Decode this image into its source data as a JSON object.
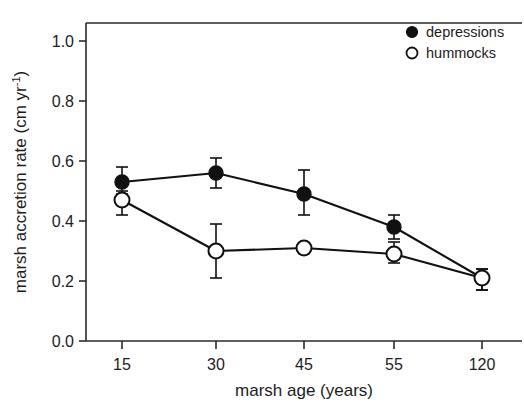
{
  "chart_data": {
    "type": "line",
    "title": "",
    "xlabel": "marsh age (years)",
    "ylabel": "marsh accretion rate (cm yr",
    "ylabel_sup": "-1",
    "ylabel_tail": ")",
    "categories": [
      "15",
      "30",
      "45",
      "55",
      "120"
    ],
    "xtick_labels": [
      "15",
      "30",
      "45",
      "55",
      "120"
    ],
    "ytick_labels": [
      "0.0",
      "0.2",
      "0.4",
      "0.6",
      "0.8",
      "1.0"
    ],
    "ytick_values": [
      0.0,
      0.2,
      0.4,
      0.6,
      0.8,
      1.0
    ],
    "ylim": [
      0.0,
      1.06
    ],
    "grid": false,
    "legend_position": "top-right",
    "series": [
      {
        "name": "depressions",
        "marker": "filled-circle",
        "color": "#111111",
        "values": [
          0.53,
          0.56,
          0.49,
          0.38,
          0.21
        ],
        "err_low": [
          0.04,
          0.05,
          0.07,
          0.04,
          0.04
        ],
        "err_high": [
          0.05,
          0.05,
          0.08,
          0.04,
          0.03
        ]
      },
      {
        "name": "hummocks",
        "marker": "open-circle",
        "color": "#111111",
        "values": [
          0.47,
          0.3,
          0.31,
          0.29,
          0.21
        ],
        "err_low": [
          0.05,
          0.09,
          0.01,
          0.03,
          0.04
        ],
        "err_high": [
          0.03,
          0.09,
          0.01,
          0.04,
          0.03
        ]
      }
    ]
  },
  "legend": {
    "entries": [
      {
        "label": "depressions",
        "marker": "filled-circle"
      },
      {
        "label": "hummocks",
        "marker": "open-circle"
      }
    ]
  }
}
